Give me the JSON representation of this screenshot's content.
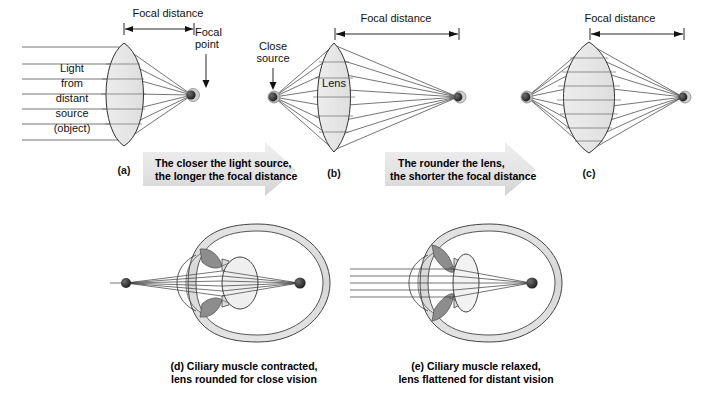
{
  "figure": {
    "background_color": "#ffffff",
    "ink_color": "#111111",
    "lens_fill": "#e9e9e9",
    "arrow_fill": "#e3e3e3",
    "muscle_fill": "#8a8a8a"
  },
  "panels": {
    "a": {
      "letter": "(a)",
      "focal_distance_label": "Focal distance",
      "focal_point_label": "Focal point",
      "light_lines": [
        "Light",
        "from",
        "distant",
        "source",
        "(object)"
      ]
    },
    "b": {
      "letter": "(b)",
      "focal_distance_label": "Focal distance",
      "close_source_label": "Close\nsource",
      "close_source_line1": "Close",
      "close_source_line2": "source",
      "lens_label": "Lens"
    },
    "c": {
      "letter": "(c)",
      "focal_distance_label": "Focal distance"
    },
    "d": {
      "caption_line1": "(d) Ciliary muscle contracted,",
      "caption_line2": "lens rounded for close vision"
    },
    "e": {
      "caption_line1": "(e) Ciliary muscle relaxed,",
      "caption_line2": "lens flattened for distant vision"
    }
  },
  "arrows": {
    "arrow1_line1": "The closer the light source,",
    "arrow1_line2": "the longer the focal distance",
    "arrow2_line1": "The rounder the lens,",
    "arrow2_line2": "the shorter the focal distance"
  }
}
